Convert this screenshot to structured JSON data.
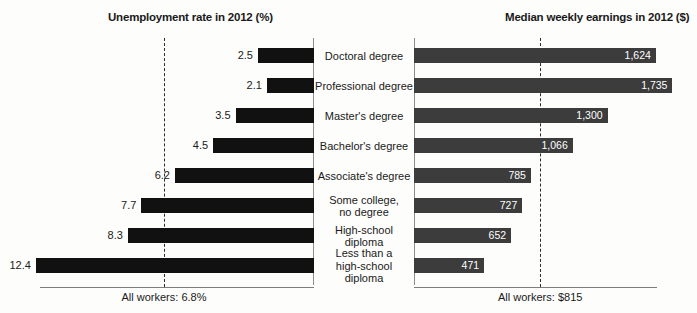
{
  "chart_data": {
    "type": "bar",
    "title": "",
    "categories": [
      "Doctoral degree",
      "Professional degree",
      "Master's degree",
      "Bachelor's degree",
      "Associate's degree",
      "Some college,\nno degree",
      "High-school\ndiploma",
      "Less than a\nhigh-school\ndiploma"
    ],
    "series": [
      {
        "name": "Unemployment rate in 2012 (%)",
        "values": [
          2.5,
          2.1,
          3.5,
          4.5,
          6.2,
          7.7,
          8.3,
          12.4
        ],
        "labels": [
          "2.5",
          "2.1",
          "3.5",
          "4.5",
          "6.2",
          "7.7",
          "8.3",
          "12.4"
        ],
        "orientation": "left",
        "color": "#111111",
        "xlim": [
          0,
          14
        ],
        "reference_value": 6.8,
        "reference_label": "All workers: 6.8%"
      },
      {
        "name": "Median weekly earnings in 2012 ($)",
        "values": [
          1624,
          1735,
          1300,
          1066,
          785,
          727,
          652,
          471
        ],
        "labels": [
          "1,624",
          "1,735",
          "1,300",
          "1,066",
          "785",
          "727",
          "652",
          "471"
        ],
        "orientation": "right",
        "color": "#3c3c3c",
        "xlim": [
          0,
          1900
        ],
        "reference_value": 815,
        "reference_label": "All workers: $815"
      }
    ],
    "xlabel": "",
    "ylabel": "",
    "grid": false,
    "legend": "none"
  },
  "headers": {
    "left": "Unemployment rate in 2012 (%)",
    "right": "Median weekly earnings in 2012 ($)"
  },
  "footers": {
    "left": "All workers: 6.8%",
    "right": "All workers: $815"
  },
  "rows": [
    {
      "category": "Doctoral degree",
      "cat_line1": "Doctoral degree",
      "cat_line2": "",
      "cat_line3": "",
      "rate": "2.5",
      "earnings": "1,624"
    },
    {
      "category": "Professional degree",
      "cat_line1": "Professional degree",
      "cat_line2": "",
      "cat_line3": "",
      "rate": "2.1",
      "earnings": "1,735"
    },
    {
      "category": "Master's degree",
      "cat_line1": "Master's degree",
      "cat_line2": "",
      "cat_line3": "",
      "rate": "3.5",
      "earnings": "1,300"
    },
    {
      "category": "Bachelor's degree",
      "cat_line1": "Bachelor's degree",
      "cat_line2": "",
      "cat_line3": "",
      "rate": "4.5",
      "earnings": "1,066"
    },
    {
      "category": "Associate's degree",
      "cat_line1": "Associate's degree",
      "cat_line2": "",
      "cat_line3": "",
      "rate": "6.2",
      "earnings": "785"
    },
    {
      "category": "Some college, no degree",
      "cat_line1": "Some college,",
      "cat_line2": "no degree",
      "cat_line3": "",
      "rate": "7.7",
      "earnings": "727"
    },
    {
      "category": "High-school diploma",
      "cat_line1": "High-school",
      "cat_line2": "diploma",
      "cat_line3": "",
      "rate": "8.3",
      "earnings": "652"
    },
    {
      "category": "Less than a high-school diploma",
      "cat_line1": "Less than a",
      "cat_line2": "high-school",
      "cat_line3": "diploma",
      "rate": "12.4",
      "earnings": "471"
    }
  ]
}
